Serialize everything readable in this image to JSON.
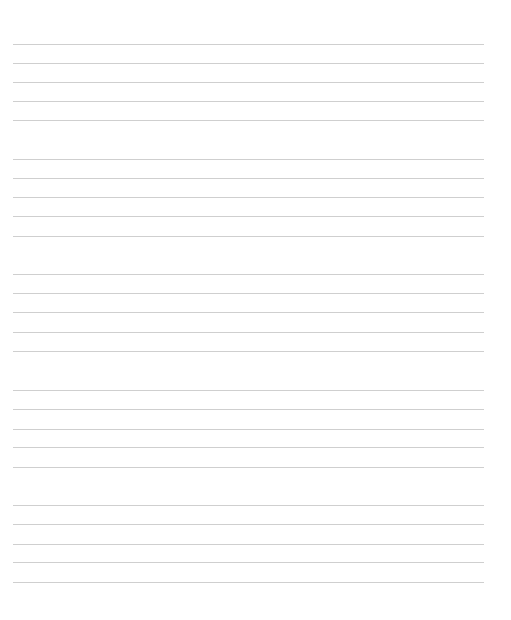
{
  "page": {
    "type": "lined-paper",
    "background_color": "#ffffff",
    "line_color": "#cfcfcf",
    "line_left_x": 13,
    "line_right_x": 484,
    "groups": [
      {
        "lines_y": [
          44,
          63,
          82,
          101,
          120
        ]
      },
      {
        "lines_y": [
          159,
          178,
          197,
          216,
          236
        ]
      },
      {
        "lines_y": [
          274,
          293,
          312,
          332,
          351
        ]
      },
      {
        "lines_y": [
          390,
          409,
          429,
          447,
          467
        ]
      },
      {
        "lines_y": [
          505,
          524,
          544,
          562,
          582
        ]
      }
    ]
  }
}
